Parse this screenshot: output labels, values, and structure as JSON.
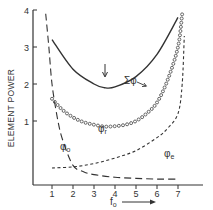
{
  "chart_data": {
    "type": "line",
    "title": "",
    "xlabel": "f",
    "xlabel_subscript": "o",
    "ylabel": "ELEMENT POWER",
    "xlim": [
      0,
      8
    ],
    "ylim": [
      -0.73,
      4
    ],
    "x_ticks": [
      1,
      2,
      3,
      4,
      5,
      6,
      7
    ],
    "y_ticks": [
      1,
      2,
      3,
      4
    ],
    "grid": false,
    "legend": "inline labels",
    "series": [
      {
        "name": "Σφ",
        "style": "solid",
        "x": [
          1,
          2,
          3,
          3.5,
          4,
          5,
          6,
          7
        ],
        "y": [
          3.2,
          2.4,
          2.0,
          1.9,
          1.92,
          2.2,
          2.8,
          3.8
        ]
      },
      {
        "name": "φr",
        "style": "circles",
        "x": [
          1,
          1.5,
          2,
          2.5,
          3,
          3.5,
          4,
          4.5,
          5,
          5.5,
          6,
          6.5,
          7,
          7.2
        ],
        "y": [
          1.6,
          1.3,
          1.1,
          0.97,
          0.9,
          0.85,
          0.86,
          0.9,
          1.0,
          1.2,
          1.5,
          2.1,
          3.0,
          3.9
        ]
      },
      {
        "name": "φe",
        "style": "short-dash",
        "x": [
          1,
          2,
          3,
          4,
          5,
          6,
          6.5,
          7,
          7.2,
          7.3
        ],
        "y": [
          -0.27,
          -0.24,
          -0.15,
          0.0,
          0.2,
          0.55,
          0.8,
          1.2,
          2.0,
          3.3
        ]
      },
      {
        "name": "φo",
        "style": "long-dash",
        "x": [
          0.7,
          0.85,
          1,
          1.25,
          1.5,
          2,
          2.5,
          3,
          4,
          5,
          6,
          7
        ],
        "y": [
          3.9,
          3.0,
          2.0,
          1.1,
          0.5,
          -0.2,
          -0.37,
          -0.45,
          -0.52,
          -0.55,
          -0.57,
          -0.57
        ]
      }
    ],
    "annotations": [
      {
        "text": "Σφ",
        "target": "Σφ",
        "arrow": true
      },
      {
        "text": "φr",
        "target": "φr"
      },
      {
        "text": "φo",
        "target": "φo"
      },
      {
        "text": "φe",
        "target": "φe"
      },
      {
        "text": "↓",
        "at_x": 3.5,
        "meaning": "minimum of Σφ"
      },
      {
        "text": "→",
        "meaning": "increasing fo arrow"
      }
    ]
  },
  "labels": {
    "ylabel": "ELEMENT POWER",
    "xlabel_main": "f",
    "xlabel_sub": "o",
    "sum_phi": "Σφ",
    "phi": "φ",
    "phi_r_sub": "r",
    "phi_o_sub": "o",
    "phi_e_sub": "e",
    "xticks": [
      "1",
      "2",
      "3",
      "4",
      "5",
      "6",
      "7"
    ],
    "yticks": [
      "1",
      "2",
      "3",
      "4"
    ]
  },
  "colors": {
    "ink": "#333333",
    "background": "#ffffff"
  }
}
